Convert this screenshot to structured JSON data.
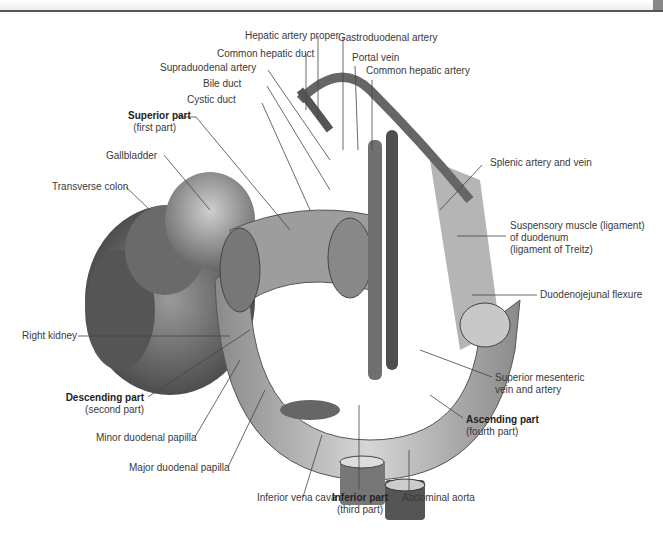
{
  "figure": {
    "labels": {
      "hepatic_artery_proper": "Hepatic artery proper",
      "gastroduodenal_artery": "Gastroduodenal artery",
      "common_hepatic_duct": "Common hepatic duct",
      "portal_vein": "Portal vein",
      "supraduodenal_artery": "Supraduodenal artery",
      "common_hepatic_artery": "Common hepatic artery",
      "bile_duct": "Bile duct",
      "cystic_duct": "Cystic duct",
      "superior_part": "Superior part",
      "superior_part_sub": "(first part)",
      "gallbladder": "Gallbladder",
      "transverse_colon": "Transverse colon",
      "splenic_artery_vein": "Splenic artery and vein",
      "suspensory_muscle_1": "Suspensory muscle (ligament)",
      "suspensory_muscle_2": "of duodenum",
      "suspensory_muscle_3": "(ligament of Treitz)",
      "duodenojejunal_flexure": "Duodenojejunal flexure",
      "right_kidney": "Right kidney",
      "descending_part": "Descending part",
      "descending_part_sub": "(second part)",
      "minor_papilla": "Minor duodenal papilla",
      "major_papilla": "Major duodenal papilla",
      "sup_mesenteric_1": "Superior mesenteric",
      "sup_mesenteric_2": "vein and artery",
      "ascending_part": "Ascending part",
      "ascending_part_sub": "(fourth part)",
      "inferior_vena_cava": "Inferior vena cava",
      "inferior_part": "Inferior part",
      "inferior_part_sub": "(third part)",
      "abdominal_aorta": "Abdominal aorta"
    }
  }
}
